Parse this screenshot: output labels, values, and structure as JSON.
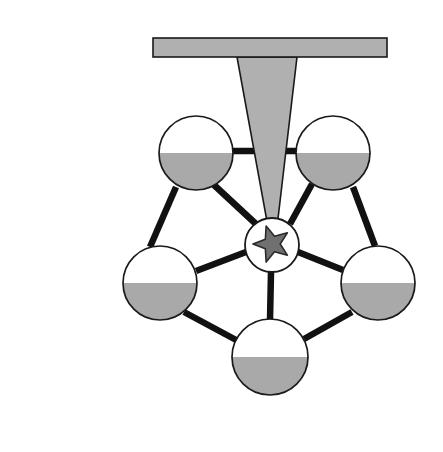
{
  "canvas": {
    "width": 443,
    "height": 452,
    "background": "#ffffff"
  },
  "diagram": {
    "type": "node-link-diagram"
  },
  "palette": {
    "fill_light_gray": "#b0b0b0",
    "node_fill_gray": "#a9a9a9",
    "star_fill_gray": "#707070",
    "outline_black": "#1a1a1a",
    "edge_black": "#111111",
    "node_background": "#ffffff"
  },
  "funnel": {
    "name": "funnel-assembly",
    "bar": {
      "label": "horizontal-bar",
      "x": 153,
      "y": 38,
      "width": 234,
      "height": 19,
      "fill": "#b0b0b0",
      "stroke": "#1a1a1a",
      "stroke_width": 1.6
    },
    "cone": {
      "label": "tapered-cone",
      "points": "237,57 297,57 277,227 268,227",
      "fill": "#b0b0b0",
      "stroke": "#1a1a1a",
      "stroke_width": 1.6
    }
  },
  "center_node": {
    "name": "center-star-node",
    "cx": 272,
    "cy": 245,
    "r": 27,
    "fill": "#ffffff",
    "stroke": "#1a1a1a",
    "stroke_width": 1.8,
    "star": {
      "label": "five-point-star",
      "cx": 272,
      "cy": 244,
      "outer_r": 19,
      "inner_r": 8.2,
      "rotation_deg": -18,
      "fill": "#707070",
      "stroke": "#2a2a2a",
      "stroke_width": 1.6
    }
  },
  "nodes": [
    {
      "id": "node-top-left",
      "label": "top-left-gauge-node",
      "cx": 196,
      "cy": 153,
      "r": 37,
      "fill_level": 0.5,
      "fill": "#a9a9a9",
      "stroke": "#1a1a1a",
      "stroke_width": 1.7
    },
    {
      "id": "node-top-right",
      "label": "top-right-gauge-node",
      "cx": 333,
      "cy": 153,
      "r": 37,
      "fill_level": 0.5,
      "fill": "#a9a9a9",
      "stroke": "#1a1a1a",
      "stroke_width": 1.7
    },
    {
      "id": "node-left",
      "label": "left-gauge-node",
      "cx": 160,
      "cy": 283,
      "r": 37,
      "fill_level": 0.5,
      "fill": "#a9a9a9",
      "stroke": "#1a1a1a",
      "stroke_width": 1.7
    },
    {
      "id": "node-right",
      "label": "right-gauge-node",
      "cx": 378,
      "cy": 283,
      "r": 37,
      "fill_level": 0.5,
      "fill": "#a9a9a9",
      "stroke": "#1a1a1a",
      "stroke_width": 1.7
    },
    {
      "id": "node-bottom",
      "label": "bottom-gauge-node",
      "cx": 270,
      "cy": 357,
      "r": 38,
      "fill_level": 0.5,
      "fill": "#a9a9a9",
      "stroke": "#1a1a1a",
      "stroke_width": 1.7
    }
  ],
  "edges": [
    {
      "id": "edge-center-top-left",
      "from": "center",
      "to": "node-top-left",
      "x1": 256,
      "y1": 224,
      "x2": 214,
      "y2": 185,
      "width": 6.5,
      "color": "#111111"
    },
    {
      "id": "edge-center-top-right",
      "from": "center",
      "to": "node-top-right",
      "x1": 290,
      "y1": 224,
      "x2": 312,
      "y2": 184,
      "width": 6.5,
      "color": "#111111"
    },
    {
      "id": "edge-center-left",
      "from": "center",
      "to": "node-left",
      "x1": 246,
      "y1": 252,
      "x2": 196,
      "y2": 271,
      "width": 6.5,
      "color": "#111111"
    },
    {
      "id": "edge-center-right",
      "from": "center",
      "to": "node-right",
      "x1": 298,
      "y1": 252,
      "x2": 343,
      "y2": 270,
      "width": 6.5,
      "color": "#111111"
    },
    {
      "id": "edge-center-bottom",
      "from": "center",
      "to": "node-bottom",
      "x1": 271,
      "y1": 272,
      "x2": 270,
      "y2": 320,
      "width": 6.5,
      "color": "#111111"
    },
    {
      "id": "edge-top-left-top-right",
      "from": "node-top-left",
      "to": "node-top-right",
      "x1": 233,
      "y1": 151,
      "x2": 296,
      "y2": 151,
      "width": 6.5,
      "color": "#111111"
    },
    {
      "id": "edge-top-left-left",
      "from": "node-top-left",
      "to": "node-left",
      "x1": 176,
      "y1": 187,
      "x2": 150,
      "y2": 247,
      "width": 6.5,
      "color": "#111111"
    },
    {
      "id": "edge-top-right-right",
      "from": "node-top-right",
      "to": "node-right",
      "x1": 353,
      "y1": 187,
      "x2": 375,
      "y2": 246,
      "width": 6.5,
      "color": "#111111"
    },
    {
      "id": "edge-left-bottom",
      "from": "node-left",
      "to": "node-bottom",
      "x1": 184,
      "y1": 312,
      "x2": 238,
      "y2": 341,
      "width": 6.5,
      "color": "#111111"
    },
    {
      "id": "edge-right-bottom",
      "from": "node-right",
      "to": "node-bottom",
      "x1": 352,
      "y1": 312,
      "x2": 304,
      "y2": 339,
      "width": 6.5,
      "color": "#111111"
    }
  ]
}
